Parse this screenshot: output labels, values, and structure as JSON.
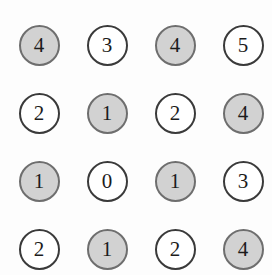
{
  "figure": {
    "background_color": "#fdfdfd",
    "filled_fill_color": "#d2d2d2",
    "filled_border_color": "#6e6e6e",
    "empty_fill_color": "#ffffff",
    "empty_border_color": "#3a3a3a",
    "digit_color": "#1c1c1c",
    "rows": 4,
    "columns": 4
  },
  "chart_data": {
    "type": "heatmap",
    "title": "",
    "subtitle": "",
    "xlabel": "",
    "ylabel": "",
    "grid": false,
    "legend": "none",
    "categories": [
      "col1",
      "col2",
      "col3",
      "col4"
    ],
    "row_labels": [
      "row1",
      "row2",
      "row3",
      "row4"
    ],
    "values": [
      [
        4,
        3,
        4,
        5
      ],
      [
        2,
        1,
        2,
        4
      ],
      [
        1,
        0,
        1,
        3
      ],
      [
        2,
        1,
        2,
        4
      ]
    ],
    "shaded": [
      [
        true,
        false,
        true,
        false
      ],
      [
        false,
        true,
        false,
        true
      ],
      [
        true,
        false,
        true,
        false
      ],
      [
        false,
        true,
        false,
        true
      ]
    ]
  },
  "cells": [
    [
      {
        "value": "4",
        "state": "filled"
      },
      {
        "value": "3",
        "state": "empty"
      },
      {
        "value": "4",
        "state": "filled"
      },
      {
        "value": "5",
        "state": "empty"
      }
    ],
    [
      {
        "value": "2",
        "state": "empty"
      },
      {
        "value": "1",
        "state": "filled"
      },
      {
        "value": "2",
        "state": "empty"
      },
      {
        "value": "4",
        "state": "filled"
      }
    ],
    [
      {
        "value": "1",
        "state": "filled"
      },
      {
        "value": "0",
        "state": "empty"
      },
      {
        "value": "1",
        "state": "filled"
      },
      {
        "value": "3",
        "state": "empty"
      }
    ],
    [
      {
        "value": "2",
        "state": "empty"
      },
      {
        "value": "1",
        "state": "filled"
      },
      {
        "value": "2",
        "state": "empty"
      },
      {
        "value": "4",
        "state": "filled"
      }
    ]
  ]
}
